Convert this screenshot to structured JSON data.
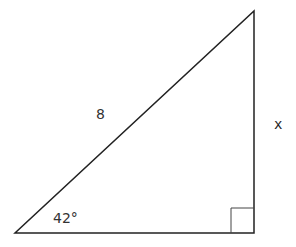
{
  "diagram": {
    "type": "right-triangle",
    "vertices": {
      "bottom_left": [
        15,
        233
      ],
      "bottom_right": [
        254,
        233
      ],
      "top_right": [
        254,
        11
      ]
    },
    "right_angle_marker": {
      "x": 231,
      "y": 208,
      "size": 23,
      "corner": "bottom_right"
    },
    "labels": {
      "hypotenuse": "8",
      "opposite_side": "x",
      "angle": "42°"
    },
    "stroke_color": "#222222",
    "text_color": "#333333"
  }
}
